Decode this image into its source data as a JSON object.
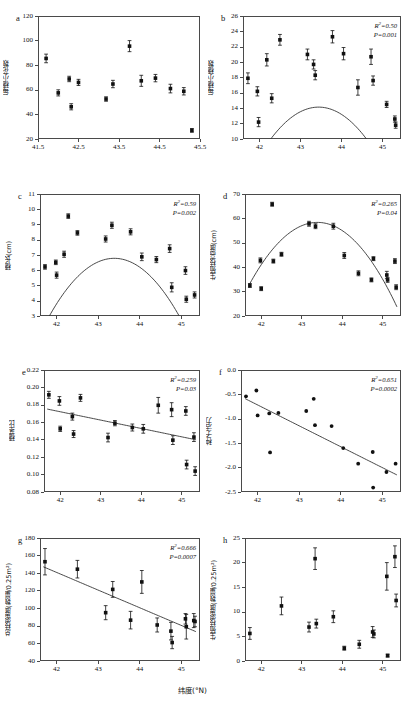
{
  "figure": {
    "xlabel": "纬度(°N)",
    "panels": [
      "a",
      "b",
      "c",
      "d",
      "e",
      "f",
      "g",
      "h"
    ]
  },
  "chart_data": [
    {
      "type": "scatter",
      "panel": "a",
      "title": "",
      "ylabel": "每穗小花数",
      "xlabel": "纬度(°N)",
      "xlim": [
        41.5,
        45.5
      ],
      "ylim": [
        20,
        120
      ],
      "xticks": [
        "41.5",
        "42.5",
        "43.5",
        "44.5",
        "45.5"
      ],
      "xtickvals": [
        41.5,
        42.5,
        43.5,
        44.5,
        45.5
      ],
      "yticks": [
        "20",
        "40",
        "60",
        "80",
        "100",
        "120"
      ],
      "ytickvals": [
        20,
        40,
        60,
        80,
        100,
        120
      ],
      "stats": null,
      "fit": null,
      "points": [
        {
          "x": 41.7,
          "y": 85.5,
          "err": 3.5
        },
        {
          "x": 42.0,
          "y": 57.5,
          "err": 2.5
        },
        {
          "x": 42.27,
          "y": 68.8,
          "err": 2.2
        },
        {
          "x": 42.32,
          "y": 46.2,
          "err": 2.5
        },
        {
          "x": 42.5,
          "y": 66.0,
          "err": 2.5
        },
        {
          "x": 43.18,
          "y": 52.5,
          "err": 1.8
        },
        {
          "x": 43.35,
          "y": 64.7,
          "err": 3.0
        },
        {
          "x": 43.76,
          "y": 95.5,
          "err": 4.5
        },
        {
          "x": 44.05,
          "y": 67.3,
          "err": 4.5
        },
        {
          "x": 44.4,
          "y": 69.5,
          "err": 3.0
        },
        {
          "x": 44.77,
          "y": 61.0,
          "err": 3.5
        },
        {
          "x": 45.1,
          "y": 58.8,
          "err": 3.0
        },
        {
          "x": 45.3,
          "y": 27.0,
          "err": 1.5
        }
      ]
    },
    {
      "type": "scatter",
      "panel": "b",
      "title": "",
      "ylabel": "每穗小穗数",
      "xlabel": "纬度(°N)",
      "xlim": [
        41.6,
        45.45
      ],
      "ylim": [
        10,
        26
      ],
      "xticks": [
        "42",
        "43",
        "44",
        "45"
      ],
      "xtickvals": [
        42,
        43,
        44,
        45
      ],
      "yticks": [
        "10",
        "12",
        "14",
        "16",
        "18",
        "20",
        "22",
        "24",
        "26"
      ],
      "ytickvals": [
        10,
        12,
        14,
        16,
        18,
        20,
        22,
        24,
        26
      ],
      "stats": {
        "r2_label": "R",
        "r2_sup": "2",
        "r2_value": "=0.50",
        "p_text": "P=0.001"
      },
      "fit": {
        "kind": "quadratic",
        "a": -3.05,
        "b": 265.0,
        "c": -5742.0,
        "x_start": 41.65,
        "x_end": 45.35
      },
      "points": [
        {
          "x": 41.72,
          "y": 17.9,
          "err": 0.7
        },
        {
          "x": 41.95,
          "y": 16.2,
          "err": 0.6
        },
        {
          "x": 41.98,
          "y": 12.2,
          "err": 0.6
        },
        {
          "x": 42.18,
          "y": 20.3,
          "err": 0.8
        },
        {
          "x": 42.3,
          "y": 15.3,
          "err": 0.6
        },
        {
          "x": 42.5,
          "y": 22.9,
          "err": 0.7
        },
        {
          "x": 43.17,
          "y": 21.0,
          "err": 0.7
        },
        {
          "x": 43.32,
          "y": 19.7,
          "err": 0.6
        },
        {
          "x": 43.36,
          "y": 18.3,
          "err": 0.6
        },
        {
          "x": 43.78,
          "y": 23.3,
          "err": 0.8
        },
        {
          "x": 44.05,
          "y": 21.1,
          "err": 0.8
        },
        {
          "x": 44.4,
          "y": 16.7,
          "err": 1.0
        },
        {
          "x": 44.72,
          "y": 20.7,
          "err": 1.0
        },
        {
          "x": 44.77,
          "y": 17.6,
          "err": 0.6
        },
        {
          "x": 45.1,
          "y": 14.5,
          "err": 0.4
        },
        {
          "x": 45.3,
          "y": 12.6,
          "err": 0.4
        },
        {
          "x": 45.32,
          "y": 11.8,
          "err": 0.4
        }
      ]
    },
    {
      "type": "scatter",
      "panel": "c",
      "title": "",
      "ylabel": "穗长(cm)",
      "xlabel": "纬度(°N)",
      "xlim": [
        41.6,
        45.45
      ],
      "ylim": [
        3,
        11
      ],
      "xticks": [
        "42",
        "43",
        "44",
        "45"
      ],
      "xtickvals": [
        42,
        43,
        44,
        45
      ],
      "yticks": [
        "3",
        "4",
        "5",
        "6",
        "7",
        "8",
        "9",
        "10",
        "11"
      ],
      "ytickvals": [
        3,
        4,
        5,
        6,
        7,
        8,
        9,
        10,
        11
      ],
      "stats": {
        "r2_label": "R",
        "r2_sup": "2",
        "r2_value": "=0.59",
        "p_text": "P=0.002"
      },
      "fit": {
        "kind": "quadratic",
        "a": -1.55,
        "b": 134.5,
        "c": -2911.0,
        "x_start": 41.65,
        "x_end": 45.35
      },
      "points": [
        {
          "x": 41.72,
          "y": 6.22,
          "err": 0.15
        },
        {
          "x": 41.98,
          "y": 6.52,
          "err": 0.15
        },
        {
          "x": 42.0,
          "y": 5.68,
          "err": 0.2
        },
        {
          "x": 42.18,
          "y": 7.05,
          "err": 0.2
        },
        {
          "x": 42.28,
          "y": 9.55,
          "err": 0.15
        },
        {
          "x": 42.5,
          "y": 8.45,
          "err": 0.15
        },
        {
          "x": 43.18,
          "y": 8.05,
          "err": 0.2
        },
        {
          "x": 43.33,
          "y": 8.95,
          "err": 0.2
        },
        {
          "x": 43.78,
          "y": 8.52,
          "err": 0.2
        },
        {
          "x": 44.05,
          "y": 6.88,
          "err": 0.25
        },
        {
          "x": 44.4,
          "y": 6.7,
          "err": 0.2
        },
        {
          "x": 44.72,
          "y": 7.42,
          "err": 0.25
        },
        {
          "x": 44.77,
          "y": 4.88,
          "err": 0.3
        },
        {
          "x": 45.1,
          "y": 5.98,
          "err": 0.25
        },
        {
          "x": 45.12,
          "y": 4.1,
          "err": 0.2
        },
        {
          "x": 45.32,
          "y": 4.38,
          "err": 0.2
        }
      ]
    },
    {
      "type": "scatter",
      "panel": "d",
      "title": "",
      "ylabel": "生殖枝高度(cm)",
      "xlabel": "纬度(°N)",
      "xlim": [
        41.6,
        45.45
      ],
      "ylim": [
        20,
        70
      ],
      "xticks": [
        "42",
        "43",
        "44",
        "45"
      ],
      "xtickvals": [
        42,
        43,
        44,
        45
      ],
      "yticks": [
        "20",
        "30",
        "40",
        "50",
        "60",
        "70"
      ],
      "ytickvals": [
        20,
        30,
        40,
        50,
        60,
        70
      ],
      "stats": {
        "r2_label": "R",
        "r2_sup": "2",
        "r2_value": "=0.265",
        "p_text": "P=0.04"
      },
      "fit": {
        "kind": "quadratic",
        "a": -9.0,
        "b": 781.0,
        "c": -16885.0,
        "x_start": 41.72,
        "x_end": 45.35
      },
      "points": [
        {
          "x": 41.72,
          "y": 32.5,
          "err": 0.8
        },
        {
          "x": 41.98,
          "y": 42.8,
          "err": 1.0
        },
        {
          "x": 42.0,
          "y": 31.2,
          "err": 0.8
        },
        {
          "x": 42.27,
          "y": 65.8,
          "err": 0.8
        },
        {
          "x": 42.3,
          "y": 42.5,
          "err": 0.8
        },
        {
          "x": 42.5,
          "y": 45.3,
          "err": 0.8
        },
        {
          "x": 43.18,
          "y": 57.8,
          "err": 1.0
        },
        {
          "x": 43.34,
          "y": 56.8,
          "err": 1.0
        },
        {
          "x": 43.78,
          "y": 56.8,
          "err": 1.2
        },
        {
          "x": 44.05,
          "y": 44.8,
          "err": 1.2
        },
        {
          "x": 44.4,
          "y": 37.5,
          "err": 1.0
        },
        {
          "x": 44.72,
          "y": 34.8,
          "err": 0.8
        },
        {
          "x": 44.77,
          "y": 43.5,
          "err": 0.8
        },
        {
          "x": 45.1,
          "y": 36.8,
          "err": 1.5
        },
        {
          "x": 45.12,
          "y": 34.8,
          "err": 1.0
        },
        {
          "x": 45.3,
          "y": 42.5,
          "err": 1.0
        },
        {
          "x": 45.33,
          "y": 31.8,
          "err": 1.0
        }
      ]
    },
    {
      "type": "scatter",
      "panel": "e",
      "title": "",
      "ylabel": "穗茎比",
      "xlabel": "纬度(°N)",
      "xlim": [
        41.6,
        45.45
      ],
      "ylim": [
        0.08,
        0.22
      ],
      "xticks": [
        "42",
        "43",
        "44",
        "45"
      ],
      "xtickvals": [
        42,
        43,
        44,
        45
      ],
      "yticks": [
        "0.08",
        "0.10",
        "0.12",
        "0.14",
        "0.16",
        "0.18",
        "0.20",
        "0.22"
      ],
      "ytickvals": [
        0.08,
        0.1,
        0.12,
        0.14,
        0.16,
        0.18,
        0.2,
        0.22
      ],
      "stats": {
        "r2_label": "R",
        "r2_sup": "2",
        "r2_value": "=0.259",
        "p_text": "P=0.03"
      },
      "fit": {
        "kind": "linear",
        "slope": -0.0096,
        "intercept": 0.5753,
        "x_start": 41.68,
        "x_end": 45.35
      },
      "points": [
        {
          "x": 41.72,
          "y": 0.1915,
          "err": 0.004
        },
        {
          "x": 41.98,
          "y": 0.1845,
          "err": 0.005
        },
        {
          "x": 42.0,
          "y": 0.1525,
          "err": 0.003
        },
        {
          "x": 42.3,
          "y": 0.1665,
          "err": 0.004
        },
        {
          "x": 42.33,
          "y": 0.1465,
          "err": 0.004
        },
        {
          "x": 42.5,
          "y": 0.188,
          "err": 0.004
        },
        {
          "x": 43.18,
          "y": 0.1425,
          "err": 0.005
        },
        {
          "x": 43.35,
          "y": 0.159,
          "err": 0.003
        },
        {
          "x": 43.78,
          "y": 0.154,
          "err": 0.004
        },
        {
          "x": 44.05,
          "y": 0.1525,
          "err": 0.005
        },
        {
          "x": 44.42,
          "y": 0.1795,
          "err": 0.009
        },
        {
          "x": 44.75,
          "y": 0.1745,
          "err": 0.008
        },
        {
          "x": 44.78,
          "y": 0.1395,
          "err": 0.005
        },
        {
          "x": 45.1,
          "y": 0.173,
          "err": 0.005
        },
        {
          "x": 45.12,
          "y": 0.1115,
          "err": 0.005
        },
        {
          "x": 45.3,
          "y": 0.143,
          "err": 0.005
        },
        {
          "x": 45.33,
          "y": 0.104,
          "err": 0.005
        }
      ]
    },
    {
      "type": "scatter",
      "panel": "f",
      "title": "",
      "ylabel": "种子活力",
      "xlabel": "纬度(°N)",
      "xlim": [
        41.6,
        45.45
      ],
      "ylim": [
        -2.5,
        0.0
      ],
      "xticks": [
        "42",
        "43",
        "44",
        "45"
      ],
      "xtickvals": [
        42,
        43,
        44,
        45
      ],
      "yticks": [
        "-2.5",
        "-2.0",
        "-1.5",
        "-1.0",
        "-0.5",
        "0.0"
      ],
      "ytickvals": [
        -2.5,
        -2.0,
        -1.5,
        -1.0,
        -0.5,
        0.0
      ],
      "stats": {
        "r2_label": "R",
        "r2_sup": "2",
        "r2_value": "=0.651",
        "p_text": "P=0.0002"
      },
      "fit": {
        "kind": "linear",
        "slope": -0.428,
        "intercept": 17.26,
        "x_start": 41.7,
        "x_end": 45.35
      },
      "points": [
        {
          "x": 41.72,
          "y": -0.54,
          "err": 0
        },
        {
          "x": 41.97,
          "y": -0.42,
          "err": 0
        },
        {
          "x": 42.0,
          "y": -0.93,
          "err": 0
        },
        {
          "x": 42.28,
          "y": -0.89,
          "err": 0
        },
        {
          "x": 42.3,
          "y": -1.69,
          "err": 0
        },
        {
          "x": 42.5,
          "y": -0.88,
          "err": 0
        },
        {
          "x": 43.17,
          "y": -0.84,
          "err": 0
        },
        {
          "x": 43.35,
          "y": -0.59,
          "err": 0
        },
        {
          "x": 43.38,
          "y": -1.13,
          "err": 0
        },
        {
          "x": 43.78,
          "y": -1.15,
          "err": 0
        },
        {
          "x": 44.06,
          "y": -1.6,
          "err": 0
        },
        {
          "x": 44.42,
          "y": -1.92,
          "err": 0
        },
        {
          "x": 44.77,
          "y": -1.68,
          "err": 0
        },
        {
          "x": 44.78,
          "y": -2.41,
          "err": 0
        },
        {
          "x": 45.1,
          "y": -2.09,
          "err": 0
        },
        {
          "x": 45.32,
          "y": -1.92,
          "err": 0
        }
      ]
    },
    {
      "type": "scatter",
      "panel": "g",
      "title": "",
      "ylabel": "总枝密度(数量/0.25m²)",
      "xlabel": "纬度(°N)",
      "xlim": [
        41.6,
        45.45
      ],
      "ylim": [
        40,
        180
      ],
      "xticks": [
        "42",
        "43",
        "44",
        "45"
      ],
      "xtickvals": [
        42,
        43,
        44,
        45
      ],
      "yticks": [
        "40",
        "60",
        "80",
        "100",
        "120",
        "140",
        "160",
        "180"
      ],
      "ytickvals": [
        40,
        60,
        80,
        100,
        120,
        140,
        160,
        180
      ],
      "stats": {
        "r2_label": "R",
        "r2_sup": "2",
        "r2_value": "=0.666",
        "p_text": "P=0.0007"
      },
      "fit": {
        "kind": "linear",
        "slope": -20.1,
        "intercept": 985.0,
        "x_start": 41.68,
        "x_end": 45.35
      },
      "points": [
        {
          "x": 41.72,
          "y": 153.0,
          "err": 15.0
        },
        {
          "x": 42.5,
          "y": 144.5,
          "err": 10.0
        },
        {
          "x": 43.18,
          "y": 95.0,
          "err": 8.0
        },
        {
          "x": 43.35,
          "y": 121.5,
          "err": 9.0
        },
        {
          "x": 43.78,
          "y": 86.5,
          "err": 10.0
        },
        {
          "x": 44.05,
          "y": 130.0,
          "err": 13.0
        },
        {
          "x": 44.42,
          "y": 81.0,
          "err": 8.0
        },
        {
          "x": 44.75,
          "y": 74.0,
          "err": 10.0
        },
        {
          "x": 44.78,
          "y": 61.0,
          "err": 7.0
        },
        {
          "x": 45.1,
          "y": 88.0,
          "err": 6.0
        },
        {
          "x": 45.12,
          "y": 79.0,
          "err": 14.0
        },
        {
          "x": 45.3,
          "y": 86.0,
          "err": 8.0
        },
        {
          "x": 45.33,
          "y": 85.0,
          "err": 6.0
        }
      ]
    },
    {
      "type": "scatter",
      "panel": "h",
      "title": "",
      "ylabel": "生殖枝密度(数量/0.25m²)",
      "xlabel": "纬度(°N)",
      "xlim": [
        41.6,
        45.45
      ],
      "ylim": [
        0,
        25
      ],
      "xticks": [
        "42",
        "43",
        "44",
        "45"
      ],
      "xtickvals": [
        42,
        43,
        44,
        45
      ],
      "yticks": [
        "0",
        "5",
        "10",
        "15",
        "20",
        "25"
      ],
      "ytickvals": [
        0,
        5,
        10,
        15,
        20,
        25
      ],
      "stats": null,
      "fit": null,
      "points": [
        {
          "x": 41.72,
          "y": 5.6,
          "err": 1.2
        },
        {
          "x": 42.5,
          "y": 11.2,
          "err": 1.8
        },
        {
          "x": 43.18,
          "y": 6.9,
          "err": 1.0
        },
        {
          "x": 43.33,
          "y": 20.8,
          "err": 2.2
        },
        {
          "x": 43.36,
          "y": 7.6,
          "err": 0.9
        },
        {
          "x": 43.78,
          "y": 9.0,
          "err": 1.2
        },
        {
          "x": 44.05,
          "y": 2.6,
          "err": 0.4
        },
        {
          "x": 44.42,
          "y": 3.4,
          "err": 0.8
        },
        {
          "x": 44.75,
          "y": 5.9,
          "err": 1.1
        },
        {
          "x": 44.78,
          "y": 5.5,
          "err": 0.8
        },
        {
          "x": 45.1,
          "y": 17.2,
          "err": 2.8
        },
        {
          "x": 45.12,
          "y": 1.1,
          "err": 0.3
        },
        {
          "x": 45.3,
          "y": 21.2,
          "err": 2.2
        },
        {
          "x": 45.33,
          "y": 12.3,
          "err": 1.3
        }
      ]
    }
  ]
}
